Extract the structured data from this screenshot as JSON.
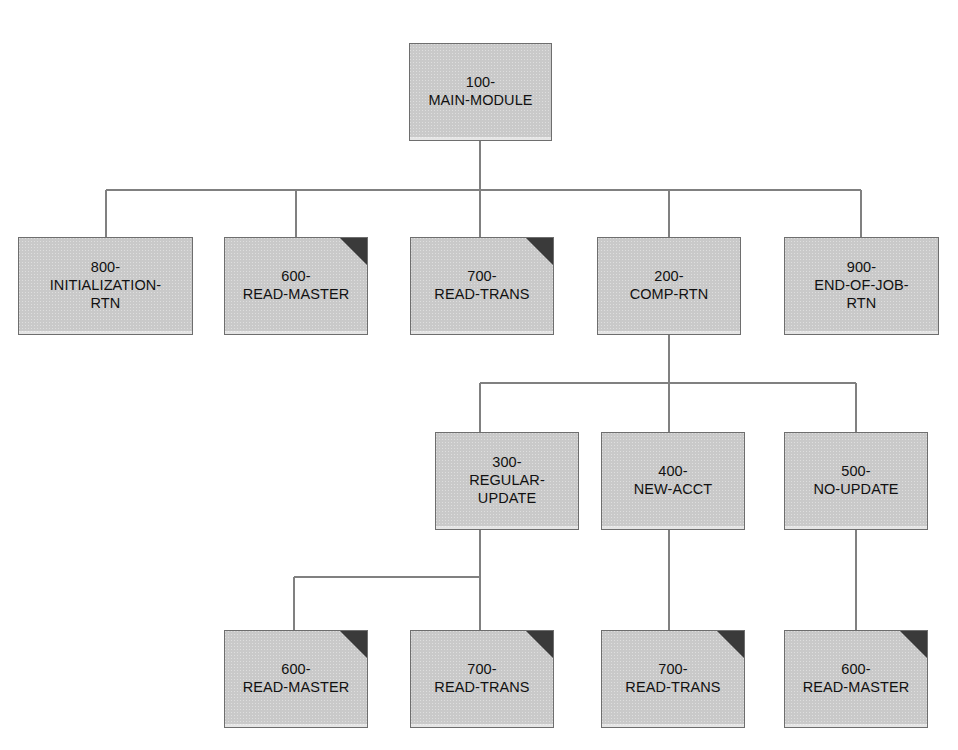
{
  "diagram": {
    "type": "structure-chart",
    "background_color": "#ffffff",
    "box_fill_color": "#d0d0d0",
    "box_border_color": "#6e6e6e",
    "connector_color": "#808080",
    "corner_flag_color": "#3a3a3a",
    "text_color": "#111111"
  },
  "legend": {
    "corner_flag_meaning": "predefined-or-reused-module"
  },
  "modules": [
    {
      "id": "m100",
      "label": "100-\nMAIN-MODULE",
      "lines": [
        "100-",
        "MAIN-MODULE"
      ],
      "level": 0,
      "x": 409,
      "y": 43,
      "w": 143,
      "h": 98,
      "corner_flag": false
    },
    {
      "id": "m800",
      "label": "800-\nINITIALIZATION-\nRTN",
      "lines": [
        "800-",
        "INITIALIZATION-",
        "RTN"
      ],
      "level": 1,
      "x": 18,
      "y": 237,
      "w": 175,
      "h": 98,
      "corner_flag": false
    },
    {
      "id": "m600a",
      "label": "600-\nREAD-MASTER",
      "lines": [
        "600-",
        "READ-MASTER"
      ],
      "level": 1,
      "x": 224,
      "y": 237,
      "w": 144,
      "h": 98,
      "corner_flag": true
    },
    {
      "id": "m700a",
      "label": "700-\nREAD-TRANS",
      "lines": [
        "700-",
        "READ-TRANS"
      ],
      "level": 1,
      "x": 410,
      "y": 237,
      "w": 144,
      "h": 98,
      "corner_flag": true
    },
    {
      "id": "m200",
      "label": "200-\nCOMP-RTN",
      "lines": [
        "200-",
        "COMP-RTN"
      ],
      "level": 1,
      "x": 597,
      "y": 237,
      "w": 144,
      "h": 98,
      "corner_flag": false
    },
    {
      "id": "m900",
      "label": "900-\nEND-OF-JOB-\nRTN",
      "lines": [
        "900-",
        "END-OF-JOB-",
        "RTN"
      ],
      "level": 1,
      "x": 784,
      "y": 237,
      "w": 155,
      "h": 98,
      "corner_flag": false
    },
    {
      "id": "m300",
      "label": "300-\nREGULAR-\nUPDATE",
      "lines": [
        "300-",
        "REGULAR-",
        "UPDATE"
      ],
      "level": 2,
      "x": 435,
      "y": 432,
      "w": 144,
      "h": 98,
      "corner_flag": false
    },
    {
      "id": "m400",
      "label": "400-\nNEW-ACCT",
      "lines": [
        "400-",
        "NEW-ACCT"
      ],
      "level": 2,
      "x": 601,
      "y": 432,
      "w": 144,
      "h": 98,
      "corner_flag": false
    },
    {
      "id": "m500",
      "label": "500-\nNO-UPDATE",
      "lines": [
        "500-",
        "NO-UPDATE"
      ],
      "level": 2,
      "x": 784,
      "y": 432,
      "w": 144,
      "h": 98,
      "corner_flag": false
    },
    {
      "id": "m600b",
      "label": "600-\nREAD-MASTER",
      "lines": [
        "600-",
        "READ-MASTER"
      ],
      "level": 3,
      "x": 224,
      "y": 630,
      "w": 144,
      "h": 98,
      "corner_flag": true
    },
    {
      "id": "m700b",
      "label": "700-\nREAD-TRANS",
      "lines": [
        "700-",
        "READ-TRANS"
      ],
      "level": 3,
      "x": 410,
      "y": 630,
      "w": 144,
      "h": 98,
      "corner_flag": true
    },
    {
      "id": "m700c",
      "label": "700-\nREAD-TRANS",
      "lines": [
        "700-",
        "READ-TRANS"
      ],
      "level": 3,
      "x": 601,
      "y": 630,
      "w": 144,
      "h": 98,
      "corner_flag": true
    },
    {
      "id": "m600c",
      "label": "600-\nREAD-MASTER",
      "lines": [
        "600-",
        "READ-MASTER"
      ],
      "level": 3,
      "x": 784,
      "y": 630,
      "w": 144,
      "h": 98,
      "corner_flag": true
    }
  ],
  "connectors": {
    "groups": [
      {
        "name": "main-module-children",
        "parent": "m100",
        "stem": {
          "x": 480,
          "y1": 141,
          "y2": 190
        },
        "bus": {
          "y": 190,
          "x1": 106,
          "x2": 861
        },
        "drops": [
          {
            "x": 106,
            "y1": 190,
            "y2": 237
          },
          {
            "x": 296,
            "y1": 190,
            "y2": 237
          },
          {
            "x": 480,
            "y1": 190,
            "y2": 237
          },
          {
            "x": 669,
            "y1": 190,
            "y2": 237
          },
          {
            "x": 861,
            "y1": 190,
            "y2": 237
          }
        ]
      },
      {
        "name": "comp-rtn-children",
        "parent": "m200",
        "stem": {
          "x": 669,
          "y1": 335,
          "y2": 383
        },
        "bus": {
          "y": 383,
          "x1": 480,
          "x2": 856
        },
        "drops": [
          {
            "x": 480,
            "y1": 383,
            "y2": 432
          },
          {
            "x": 669,
            "y1": 383,
            "y2": 432
          },
          {
            "x": 856,
            "y1": 383,
            "y2": 432
          }
        ]
      },
      {
        "name": "regular-update-children",
        "parent": "m300",
        "stem": {
          "x": 480,
          "y1": 530,
          "y2": 577
        },
        "bus": {
          "y": 577,
          "x1": 294,
          "x2": 480
        },
        "drops": [
          {
            "x": 294,
            "y1": 577,
            "y2": 630
          },
          {
            "x": 480,
            "y1": 577,
            "y2": 630
          }
        ]
      },
      {
        "name": "new-acct-child",
        "parent": "m400",
        "stem": {
          "x": 669,
          "y1": 530,
          "y2": 630
        },
        "bus": null,
        "drops": []
      },
      {
        "name": "no-update-child",
        "parent": "m500",
        "stem": {
          "x": 856,
          "y1": 530,
          "y2": 630
        },
        "bus": null,
        "drops": []
      }
    ]
  }
}
